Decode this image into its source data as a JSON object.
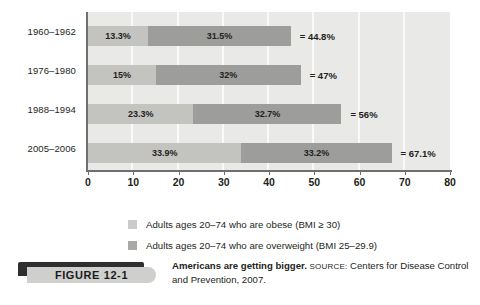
{
  "figure": {
    "tag_label": "FIGURE  12-1",
    "caption_title": "Americans are getting bigger.",
    "caption_source_word": "SOURCE:",
    "caption_source_text": "Centers for Disease Control and Prevention, 2007."
  },
  "legend": {
    "items": [
      {
        "label": "Adults ages 20–74 who are obese (BMI ≥ 30)",
        "swatch": "light-gray",
        "color": "#cbcbc8"
      },
      {
        "label": "Adults ages 20–74 who are overweight (BMI 25–29.9)",
        "swatch": "medium-gray",
        "color": "#a9a9a6"
      }
    ]
  },
  "axis": {
    "x_ticks": [
      "0",
      "10",
      "20",
      "30",
      "40",
      "50",
      "60",
      "70",
      "80"
    ],
    "y_ticks": [
      "1960–1962",
      "1976–1980",
      "1988–1994",
      "2005–2006"
    ]
  },
  "bars": [
    {
      "category": "1960–1962",
      "obese_label": "13.3%",
      "obese_value": 13.3,
      "overweight_label": "31.5%",
      "overweight_value": 31.5,
      "total_label": "= 44.8%",
      "total_value": 44.8
    },
    {
      "category": "1976–1980",
      "obese_label": "15%",
      "obese_value": 15,
      "overweight_label": "32%",
      "overweight_value": 32,
      "total_label": "= 47%",
      "total_value": 47
    },
    {
      "category": "1988–1994",
      "obese_label": "23.3%",
      "obese_value": 23.3,
      "overweight_label": "32.7%",
      "overweight_value": 32.7,
      "total_label": "= 56%",
      "total_value": 56
    },
    {
      "category": "2005–2006",
      "obese_label": "33.9%",
      "obese_value": 33.9,
      "overweight_label": "33.2%",
      "overweight_value": 33.2,
      "total_label": "= 67.1%",
      "total_value": 67.1
    }
  ],
  "chart_data": {
    "type": "bar",
    "orientation": "horizontal",
    "stacked": true,
    "title": "Americans are getting bigger.",
    "subtitle": "SOURCE: Centers for Disease Prevention and Control, 2007.",
    "xlabel": "",
    "ylabel": "",
    "categories": [
      "1960–1962",
      "1976–1980",
      "1988–1994",
      "2005–2006"
    ],
    "series": [
      {
        "name": "Adults ages 20–74 who are obese (BMI ≥ 30)",
        "values": [
          13.3,
          15,
          23.3,
          33.9
        ],
        "color": "#c3c3c0"
      },
      {
        "name": "Adults ages 20–74 who are overweight (BMI 25–29.9)",
        "values": [
          31.5,
          32,
          32.7,
          33.2
        ],
        "color": "#9d9d9b"
      }
    ],
    "totals": [
      44.8,
      47,
      56,
      67.1
    ],
    "total_labels": [
      "= 44.8%",
      "= 47%",
      "= 56%",
      "= 67.1%"
    ],
    "xlim": [
      0,
      80
    ],
    "xticks": [
      0,
      10,
      20,
      30,
      40,
      50,
      60,
      70,
      80
    ],
    "grid": "vertical-only",
    "legend_position": "bottom",
    "plot_background": "#e9e9e7",
    "gridline_color": "#fafafa"
  }
}
